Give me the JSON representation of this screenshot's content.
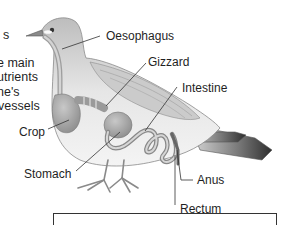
{
  "diagram": {
    "labels": {
      "oesophagus": "Oesophagus",
      "gizzard": "Gizzard",
      "intestine": "Intestine",
      "crop": "Crop",
      "stomach": "Stomach",
      "anus": "Anus",
      "rectum": "Rectum"
    },
    "side_text": {
      "line1": "s",
      "line2": "e main",
      "line3": "utrients",
      "line4": "ne's",
      "line5": "vessels"
    },
    "colors": {
      "body": "#cfcfcf",
      "organs": "#a9a9a9",
      "tail": "#555555",
      "leader_lines": "#333333",
      "text": "#1f1f1f"
    }
  }
}
